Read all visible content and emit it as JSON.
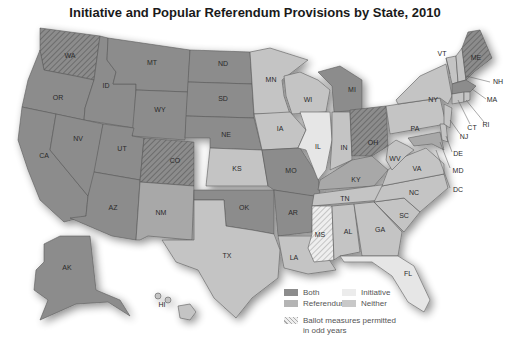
{
  "title": "Initiative and Popular Referendum Provisions by State, 2010",
  "colors": {
    "both": "#8c8c8c",
    "referendum": "#a8a8a8",
    "initiative": "#e6e6e6",
    "neither": "#c4c4c4",
    "hatch": "#6a6a6a",
    "border": "#5a5a5a"
  },
  "legend": {
    "both": "Both",
    "referendum": "Referendum",
    "initiative": "Initiative",
    "neither": "Neither",
    "odd_years_line1": "Ballot measures permitted",
    "odd_years_line2": "in odd years"
  },
  "states": {
    "WA": {
      "label": "WA",
      "category": "both",
      "odd_years": true
    },
    "OR": {
      "label": "OR",
      "category": "both",
      "odd_years": false
    },
    "CA": {
      "label": "CA",
      "category": "both",
      "odd_years": false
    },
    "ID": {
      "label": "ID",
      "category": "both",
      "odd_years": false
    },
    "NV": {
      "label": "NV",
      "category": "both",
      "odd_years": false
    },
    "MT": {
      "label": "MT",
      "category": "both",
      "odd_years": false
    },
    "WY": {
      "label": "WY",
      "category": "both",
      "odd_years": false
    },
    "UT": {
      "label": "UT",
      "category": "both",
      "odd_years": false
    },
    "AZ": {
      "label": "AZ",
      "category": "both",
      "odd_years": false
    },
    "CO": {
      "label": "CO",
      "category": "both",
      "odd_years": true
    },
    "NM": {
      "label": "NM",
      "category": "referendum",
      "odd_years": false
    },
    "ND": {
      "label": "ND",
      "category": "both",
      "odd_years": false
    },
    "SD": {
      "label": "SD",
      "category": "both",
      "odd_years": false
    },
    "NE": {
      "label": "NE",
      "category": "both",
      "odd_years": false
    },
    "KS": {
      "label": "KS",
      "category": "neither",
      "odd_years": false
    },
    "OK": {
      "label": "OK",
      "category": "both",
      "odd_years": false
    },
    "TX": {
      "label": "TX",
      "category": "neither",
      "odd_years": false
    },
    "MN": {
      "label": "MN",
      "category": "neither",
      "odd_years": false
    },
    "IA": {
      "label": "IA",
      "category": "neither",
      "odd_years": false
    },
    "MO": {
      "label": "MO",
      "category": "both",
      "odd_years": false
    },
    "AR": {
      "label": "AR",
      "category": "both",
      "odd_years": false
    },
    "LA": {
      "label": "LA",
      "category": "neither",
      "odd_years": false
    },
    "WI": {
      "label": "WI",
      "category": "neither",
      "odd_years": false
    },
    "IL": {
      "label": "IL",
      "category": "initiative",
      "odd_years": false
    },
    "MI": {
      "label": "MI",
      "category": "both",
      "odd_years": false
    },
    "IN": {
      "label": "IN",
      "category": "neither",
      "odd_years": false
    },
    "OH": {
      "label": "OH",
      "category": "both",
      "odd_years": true
    },
    "KY": {
      "label": "KY",
      "category": "referendum",
      "odd_years": false
    },
    "TN": {
      "label": "TN",
      "category": "neither",
      "odd_years": false
    },
    "MS": {
      "label": "MS",
      "category": "initiative",
      "odd_years": true
    },
    "AL": {
      "label": "AL",
      "category": "neither",
      "odd_years": false
    },
    "GA": {
      "label": "GA",
      "category": "neither",
      "odd_years": false
    },
    "FL": {
      "label": "FL",
      "category": "initiative",
      "odd_years": false
    },
    "SC": {
      "label": "SC",
      "category": "neither",
      "odd_years": false
    },
    "NC": {
      "label": "NC",
      "category": "neither",
      "odd_years": false
    },
    "VA": {
      "label": "VA",
      "category": "neither",
      "odd_years": false
    },
    "WV": {
      "label": "WV",
      "category": "neither",
      "odd_years": false
    },
    "PA": {
      "label": "PA",
      "category": "neither",
      "odd_years": false
    },
    "NY": {
      "label": "NY",
      "category": "neither",
      "odd_years": false
    },
    "VT": {
      "label": "VT",
      "category": "neither",
      "odd_years": false
    },
    "NH": {
      "label": "NH",
      "category": "neither",
      "odd_years": false
    },
    "ME": {
      "label": "ME",
      "category": "both",
      "odd_years": true
    },
    "MA": {
      "label": "MA",
      "category": "both",
      "odd_years": false
    },
    "RI": {
      "label": "RI",
      "category": "neither",
      "odd_years": false
    },
    "CT": {
      "label": "CT",
      "category": "neither",
      "odd_years": false
    },
    "NJ": {
      "label": "NJ",
      "category": "neither",
      "odd_years": false
    },
    "DE": {
      "label": "DE",
      "category": "neither",
      "odd_years": false
    },
    "MD": {
      "label": "MD",
      "category": "referendum",
      "odd_years": false
    },
    "DC": {
      "label": "DC",
      "category": "neither",
      "odd_years": false
    },
    "AK": {
      "label": "AK",
      "category": "both",
      "odd_years": false
    },
    "HI": {
      "label": "HI",
      "category": "neither",
      "odd_years": false
    }
  }
}
